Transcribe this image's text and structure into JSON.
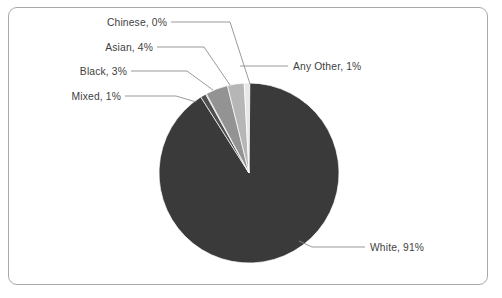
{
  "chart_data": {
    "type": "pie",
    "title": "",
    "categories": [
      "White",
      "Any Other",
      "Chinese",
      "Asian",
      "Black",
      "Mixed"
    ],
    "values": [
      91,
      1,
      0,
      4,
      3,
      1
    ],
    "labels": [
      "White, 91%",
      "Any Other, 1%",
      "Chinese, 0%",
      "Asian, 4%",
      "Black, 3%",
      "Mixed, 1%"
    ],
    "colors": [
      "#3a3a3a",
      "#4f4f4f",
      "#6e6e6e",
      "#939393",
      "#b6b6b6",
      "#e8e8e8"
    ],
    "legend": "none",
    "grid": false,
    "units": "percent",
    "start_angle_deg": 0,
    "direction": "clockwise"
  },
  "frame": {
    "border_color": "#a9a9a9",
    "background": "#ffffff"
  },
  "slices": {
    "white": {
      "label": "White, 91%",
      "value": 91,
      "color": "#3a3a3a"
    },
    "any_other": {
      "label": "Any Other, 1%",
      "value": 1,
      "color": "#4f4f4f"
    },
    "chinese": {
      "label": "Chinese, 0%",
      "value": 0,
      "color": "#6e6e6e"
    },
    "asian": {
      "label": "Asian, 4%",
      "value": 4,
      "color": "#939393"
    },
    "black": {
      "label": "Black, 3%",
      "value": 3,
      "color": "#b6b6b6"
    },
    "mixed": {
      "label": "Mixed, 1%",
      "value": 1,
      "color": "#e8e8e8"
    }
  }
}
